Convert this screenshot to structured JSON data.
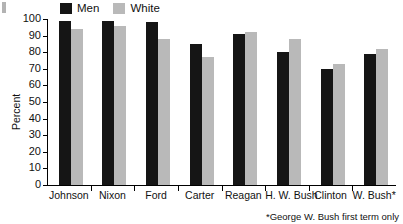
{
  "chart_data": {
    "type": "bar",
    "title": "",
    "xlabel": "",
    "ylabel": "Percent",
    "ylim": [
      0,
      100
    ],
    "ytick_step": 10,
    "yticks": [
      100,
      90,
      80,
      70,
      60,
      50,
      40,
      30,
      20,
      10,
      0
    ],
    "grid": false,
    "legend_position": "top",
    "categories": [
      "Johnson",
      "Nixon",
      "Ford",
      "Carter",
      "Reagan",
      "H. W. Bush",
      "Clinton",
      "W. Bush*"
    ],
    "series": [
      {
        "name": "Men",
        "color": "#151515",
        "values": [
          99,
          99,
          98,
          85,
          91,
          80,
          70,
          79
        ]
      },
      {
        "name": "White",
        "color": "#b9b9b9",
        "values": [
          94,
          96,
          88,
          77,
          92,
          88,
          73,
          82
        ]
      }
    ],
    "annotations": [
      "*George W. Bush first term only"
    ]
  },
  "legend": {
    "items": [
      {
        "label": "Men",
        "color": "#151515"
      },
      {
        "label": "White",
        "color": "#b9b9b9"
      }
    ]
  },
  "footnote": {
    "text": "*George W. Bush first term only"
  }
}
